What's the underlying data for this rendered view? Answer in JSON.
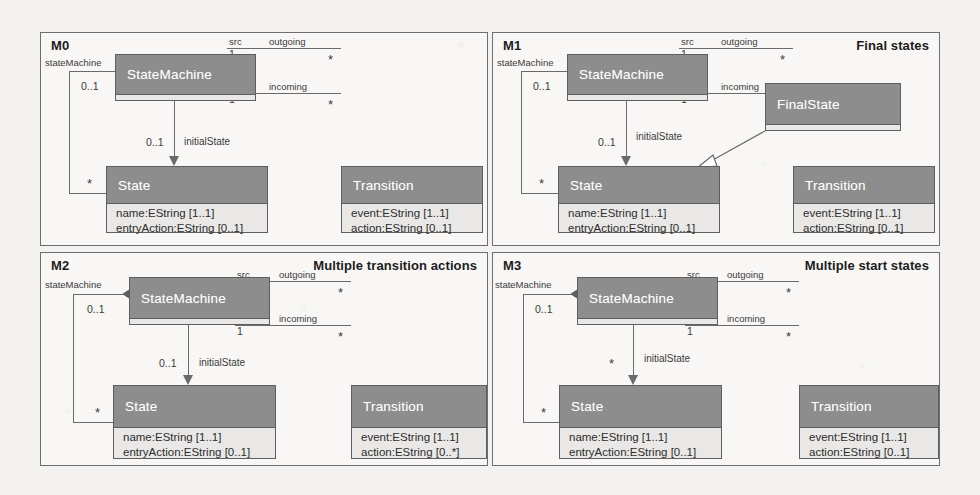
{
  "class_labels": {
    "statemachine": "StateMachine",
    "state": "State",
    "transition": "Transition",
    "finalstate": "FinalState"
  },
  "attributes": {
    "state_name": "name:EString [1..1]",
    "state_entry": "entryAction:EString [0..1]",
    "trans_event": "event:EString [1..1]",
    "trans_action_single": "action:EString [0..1]",
    "trans_action_multi": "action:EString [0..*]"
  },
  "assoc": {
    "state_machine_role": "stateMachine",
    "state_machine_mult": "0..1",
    "states_mult": "*",
    "initial_state_role": "initialState",
    "initial_state_mult_single": "0..1",
    "initial_state_mult_multi": "*",
    "src_role": "src",
    "src_mult": "1",
    "outgoing_role": "outgoing",
    "outgoing_mult": "*",
    "tgt_role": "tgt",
    "tgt_mult": "1",
    "incoming_role": "incoming",
    "incoming_mult": "*"
  },
  "panels": [
    {
      "id": "M0",
      "caption": ""
    },
    {
      "id": "M1",
      "caption": "Final states"
    },
    {
      "id": "M2",
      "caption": "Multiple transition actions"
    },
    {
      "id": "M3",
      "caption": "Multiple start states"
    }
  ],
  "colors": {
    "class_header": "#8d8d8d",
    "class_body": "#e9e8e6",
    "outline": "#5e5e5e",
    "connector": "#6a6a6a",
    "panel_border": "#6e6e6e",
    "background": "#f3f2f0"
  }
}
